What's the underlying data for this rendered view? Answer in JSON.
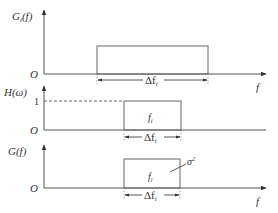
{
  "diagram": {
    "type": "spectral-density-filtering",
    "panels": [
      {
        "id": "input-spectrum",
        "ylabel_main": "G",
        "ylabel_sub": "i",
        "ylabel_arg": "(f)",
        "origin": "O",
        "xlabel": "f",
        "width_label_main": "Δf",
        "width_label_sub": "i"
      },
      {
        "id": "filter-response",
        "ylabel_main": "H(ω)",
        "level_label": "1",
        "origin": "O",
        "center_label_main": "f",
        "center_label_sub": "i",
        "width_label_main": "Δf",
        "width_label_sub": "i"
      },
      {
        "id": "output-spectrum",
        "ylabel_main": "G(f)",
        "origin": "O",
        "xlabel": "f",
        "center_label_main": "f",
        "center_label_sub": "i",
        "width_label_main": "Δf",
        "width_label_sub": "i",
        "annotation_main": "σ",
        "annotation_sup": "2"
      }
    ]
  }
}
